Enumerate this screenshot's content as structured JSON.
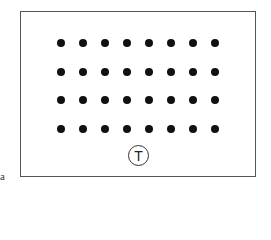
{
  "figure": {
    "panel_label": "a",
    "marker_label": "T",
    "grid": {
      "rows": 4,
      "columns": 8,
      "x_positions": [
        61,
        83,
        105,
        127,
        149,
        171,
        193,
        215
      ],
      "y_positions": [
        43,
        72,
        100,
        129
      ],
      "dot_color": "#111111"
    }
  }
}
